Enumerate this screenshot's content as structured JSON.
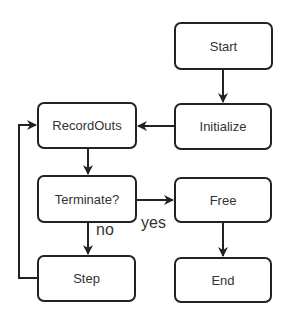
{
  "diagram": {
    "type": "flowchart",
    "nodes": {
      "start": {
        "label": "Start"
      },
      "initialize": {
        "label": "Initialize"
      },
      "recordouts": {
        "label": "RecordOuts"
      },
      "terminate": {
        "label": "Terminate?"
      },
      "step": {
        "label": "Step"
      },
      "free": {
        "label": "Free"
      },
      "end": {
        "label": "End"
      }
    },
    "edges": [
      {
        "from": "Start",
        "to": "Initialize"
      },
      {
        "from": "Initialize",
        "to": "RecordOuts"
      },
      {
        "from": "RecordOuts",
        "to": "Terminate?"
      },
      {
        "from": "Terminate?",
        "to": "Free",
        "label": "yes"
      },
      {
        "from": "Terminate?",
        "to": "Step",
        "label": "no"
      },
      {
        "from": "Step",
        "to": "RecordOuts"
      },
      {
        "from": "Free",
        "to": "End"
      }
    ],
    "edge_labels": {
      "yes": "yes",
      "no": "no"
    },
    "colors": {
      "stroke": "#222222",
      "text": "#333333",
      "background": "#ffffff"
    }
  }
}
